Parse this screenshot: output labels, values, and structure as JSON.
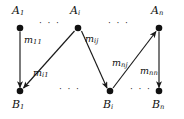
{
  "figure": {
    "background_color": "#ffffff",
    "stroke_color": "#1a1a1a",
    "node_color": "#111111"
  },
  "nodes": {
    "top": [
      {
        "id": "A1",
        "base": "A",
        "sub": "1",
        "x": 20,
        "y": 28
      },
      {
        "id": "Ai",
        "base": "A",
        "sub": "i",
        "x": 78,
        "y": 28
      },
      {
        "id": "An",
        "base": "A",
        "sub": "n",
        "x": 159,
        "y": 28
      }
    ],
    "bottom": [
      {
        "id": "B1",
        "base": "B",
        "sub": "1",
        "x": 20,
        "y": 91
      },
      {
        "id": "Bi",
        "base": "B",
        "sub": "i",
        "x": 110,
        "y": 91
      },
      {
        "id": "Bn",
        "base": "B",
        "sub": "n",
        "x": 159,
        "y": 91
      }
    ]
  },
  "edges": [
    {
      "id": "e-A1-B1",
      "from": "A1",
      "to": "B1",
      "label_base": "m",
      "label_sub": "11"
    },
    {
      "id": "e-Ai-B1",
      "from": "Ai",
      "to": "B1",
      "label_base": "m",
      "label_sub": "i1"
    },
    {
      "id": "e-Ai-Bi",
      "from": "Ai",
      "to": "Bi",
      "label_base": "m",
      "label_sub": "ij"
    },
    {
      "id": "e-An-Bi",
      "from": "An",
      "to": "Bi",
      "label_base": "m",
      "label_sub": "nj"
    },
    {
      "id": "e-An-Bn",
      "from": "An",
      "to": "Bn",
      "label_base": "m",
      "label_sub": "nn"
    }
  ],
  "ellipses": [
    {
      "id": "top-left",
      "text": "· · ·",
      "x": 42,
      "y": 22
    },
    {
      "id": "top-right",
      "text": "· · ·",
      "x": 110,
      "y": 22
    },
    {
      "id": "bottom-left",
      "text": "· · ·",
      "x": 62,
      "y": 86
    },
    {
      "id": "bottom-right",
      "text": "· · ·",
      "x": 132,
      "y": 86
    }
  ],
  "labels": {
    "A1": {
      "base": "A",
      "sub": "1"
    },
    "Ai": {
      "base": "A",
      "sub": "i"
    },
    "An": {
      "base": "A",
      "sub": "n"
    },
    "B1": {
      "base": "B",
      "sub": "1"
    },
    "Bi": {
      "base": "B",
      "sub": "i"
    },
    "Bn": {
      "base": "B",
      "sub": "n"
    },
    "m11": {
      "base": "m",
      "sub": "11"
    },
    "mi1": {
      "base": "m",
      "sub": "i1"
    },
    "mij": {
      "base": "m",
      "sub": "ij"
    },
    "mnj": {
      "base": "m",
      "sub": "nj"
    },
    "mnn": {
      "base": "m",
      "sub": "nn"
    }
  }
}
